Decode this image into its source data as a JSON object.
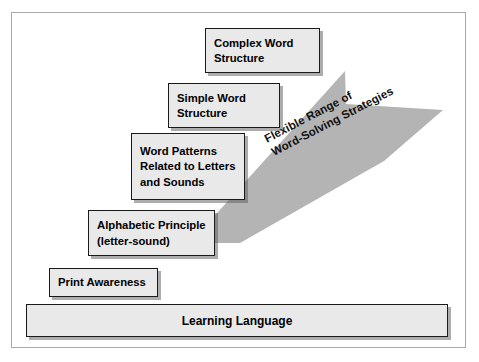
{
  "diagram": {
    "colors": {
      "frame_border": "#a8a8a8",
      "box_fill": "#e9e9e9",
      "box_border": "#1a1a1a",
      "arrow_fill": "#b4b4b4",
      "text": "#000000",
      "background": "#ffffff"
    },
    "arrow": {
      "name": "flexible-range-arrow",
      "direction": "up-right",
      "rotation_degrees": -27.5,
      "label_lines": [
        "Flexible Range of",
        "Word-Solving Strategies"
      ]
    },
    "steps": [
      {
        "id": "complex-word-structure",
        "lines": [
          "Complex Word",
          "Structure"
        ],
        "level": 5
      },
      {
        "id": "simple-word-structure",
        "lines": [
          "Simple Word",
          "Structure"
        ],
        "level": 4
      },
      {
        "id": "word-patterns",
        "lines": [
          "Word Patterns",
          "Related to Letters",
          "and Sounds"
        ],
        "level": 3
      },
      {
        "id": "alphabetic-principle",
        "lines": [
          "Alphabetic Principle",
          "(letter-sound)"
        ],
        "level": 2
      },
      {
        "id": "print-awareness",
        "lines": [
          "Print Awareness"
        ],
        "level": 1
      }
    ],
    "base": {
      "id": "learning-language",
      "label": "Learning Language"
    }
  }
}
